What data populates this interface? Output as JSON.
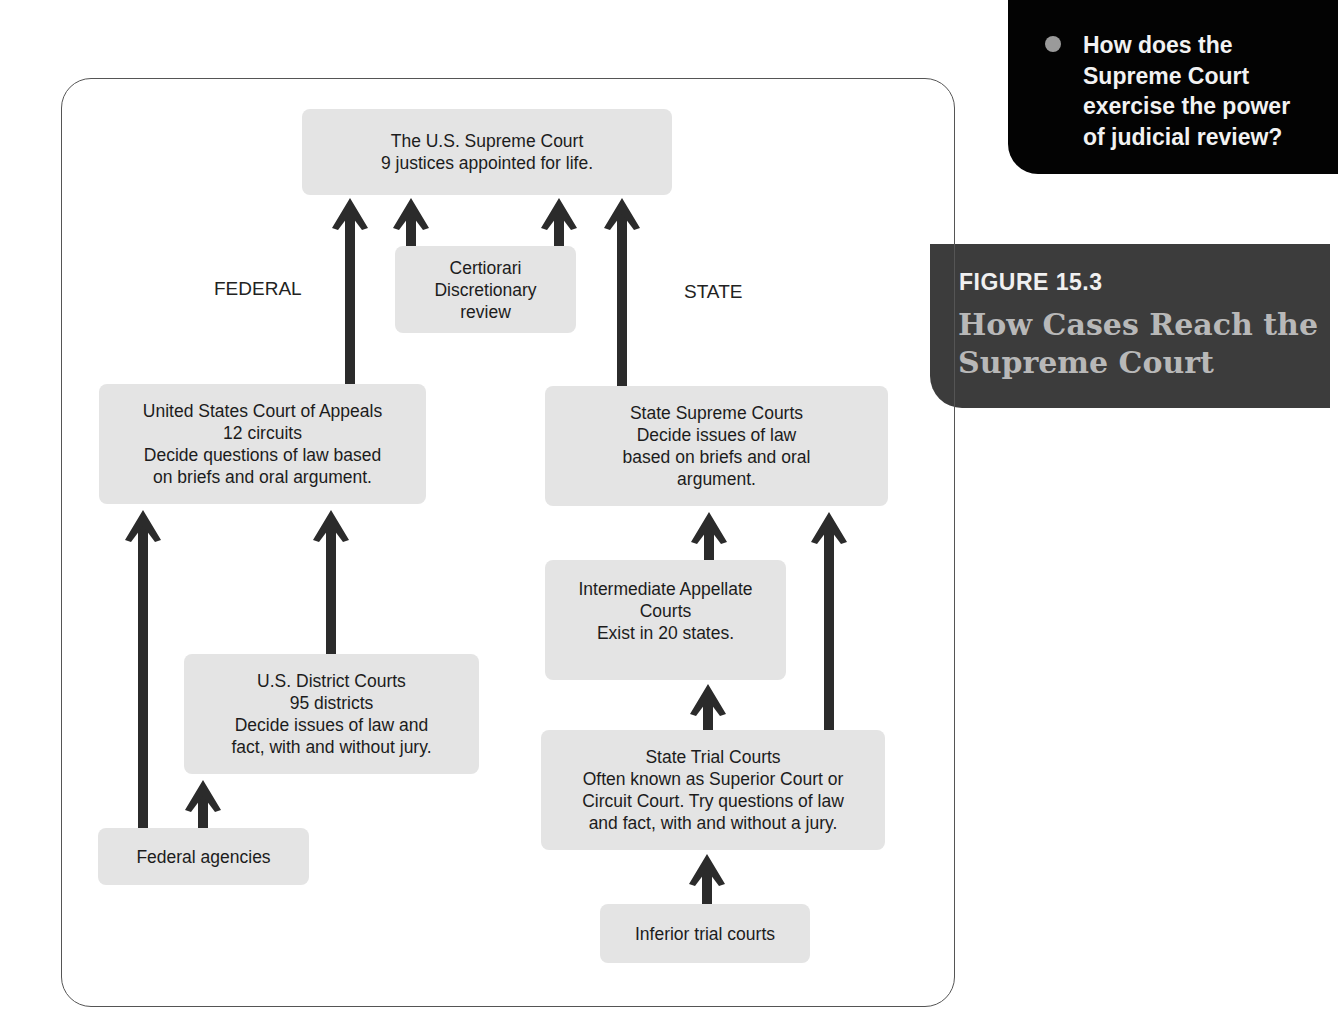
{
  "sidebar_question": {
    "bullet_icon": "circle-bullet",
    "text": "How does the\nSupreme Court\nexercise the power\nof judicial review?"
  },
  "figure": {
    "number": "FIGURE 15.3",
    "title": "How Cases Reach the\nSupreme Court"
  },
  "diagram": {
    "labels": {
      "federal": "FEDERAL",
      "state": "STATE"
    },
    "nodes": {
      "supreme_court": "The U.S. Supreme Court\n9 justices appointed for life.",
      "certiorari": "Certiorari\nDiscretionary\nreview",
      "court_of_appeals": "United States Court of Appeals\n12 circuits\nDecide questions of law based\non briefs and oral argument.",
      "state_supreme": "State Supreme Courts\nDecide issues of law\nbased on briefs and oral\nargument.",
      "intermediate_appellate": "Intermediate Appellate\nCourts\nExist in 20 states.",
      "district_courts": "U.S. District Courts\n95 districts\nDecide issues of law and\nfact, with and without jury.",
      "state_trial": "State Trial Courts\nOften known as Superior Court or\nCircuit Court. Try questions of law\nand fact, with and without a jury.",
      "federal_agencies": "Federal agencies",
      "inferior_trial": "Inferior trial courts"
    },
    "edges": [
      {
        "from": "court_of_appeals",
        "to": "supreme_court"
      },
      {
        "from": "certiorari",
        "to": "supreme_court"
      },
      {
        "from": "certiorari",
        "to": "supreme_court"
      },
      {
        "from": "state_supreme",
        "to": "supreme_court"
      },
      {
        "from": "federal_agencies",
        "to": "court_of_appeals"
      },
      {
        "from": "district_courts",
        "to": "court_of_appeals"
      },
      {
        "from": "federal_agencies",
        "to": "district_courts"
      },
      {
        "from": "intermediate_appellate",
        "to": "state_supreme"
      },
      {
        "from": "state_trial",
        "to": "state_supreme"
      },
      {
        "from": "state_trial",
        "to": "intermediate_appellate"
      },
      {
        "from": "inferior_trial",
        "to": "state_trial"
      }
    ],
    "colors": {
      "box": "#e4e4e4",
      "arrow": "#2b2b2b",
      "frame": "#555555"
    }
  }
}
